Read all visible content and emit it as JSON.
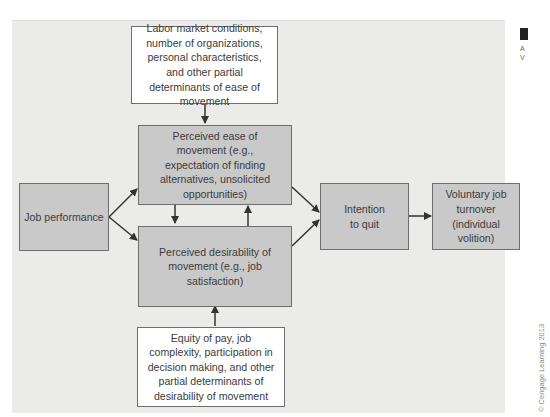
{
  "diagram": {
    "boxes": {
      "labor_market": "Labor market conditions, number of organizations, personal characteristics, and other partial determinants of ease of movement",
      "ease_of_movement": "Perceived ease of movement (e.g., expectation of finding alternatives, unsolicited opportunities)",
      "job_performance": "Job performance",
      "desirability": "Perceived desirability of movement (e.g., job satisfaction)",
      "equity_of_pay": "Equity of pay, job complexity, participation in decision making, and other partial determinants of desirability of movement",
      "intention_to_quit": "Intention to quit",
      "voluntary_turnover": "Voluntary job turnover (individual volition)"
    },
    "edges": [
      {
        "from": "labor_market",
        "to": "ease_of_movement"
      },
      {
        "from": "job_performance",
        "to": "ease_of_movement"
      },
      {
        "from": "job_performance",
        "to": "desirability"
      },
      {
        "from": "ease_of_movement",
        "to": "desirability"
      },
      {
        "from": "desirability",
        "to": "ease_of_movement"
      },
      {
        "from": "equity_of_pay",
        "to": "desirability"
      },
      {
        "from": "ease_of_movement",
        "to": "intention_to_quit"
      },
      {
        "from": "desirability",
        "to": "intention_to_quit"
      },
      {
        "from": "intention_to_quit",
        "to": "voluntary_turnover"
      }
    ],
    "colors": {
      "panel": "#ebebea",
      "determinant_box": "#c9c9c9",
      "input_box": "#ffffff",
      "border": "#6e6e6e",
      "arrow": "#333333"
    }
  },
  "side": {
    "text": "A\nV"
  },
  "copyright": "© Cengage Learning 2013"
}
